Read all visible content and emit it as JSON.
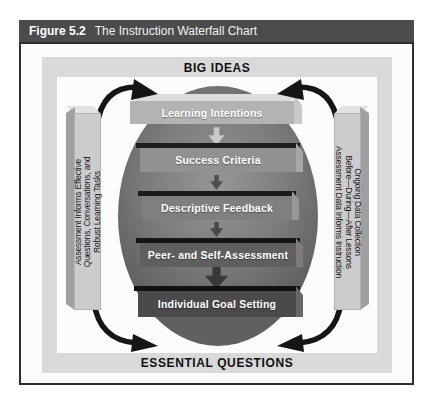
{
  "figure": {
    "label": "Figure 5.2",
    "title": "The Instruction Waterfall Chart"
  },
  "diagram": {
    "top_banner": "BIG IDEAS",
    "bottom_banner": "ESSENTIAL QUESTIONS",
    "left_bar_lines": [
      "Assessment Informs Effective",
      "Questions, Conversations, and",
      "Robust Learning Tasks"
    ],
    "right_bar_lines": [
      "Ongoing Data Collection",
      "Before—During—After Lessons",
      "Assessment Data Informs Instruction"
    ],
    "steps": [
      {
        "label": "Learning Intentions",
        "face": "#b3b3b3",
        "edge": "#dcdcdc",
        "side": "#c9c9c9"
      },
      {
        "label": "Success Criteria",
        "face": "#919191",
        "edge": "#1d1d1d",
        "side": "#a6a6a6"
      },
      {
        "label": "Descriptive Feedback",
        "face": "#7f7f7f",
        "edge": "#1b1b1b",
        "side": "#979797"
      },
      {
        "label": "Peer- and Self-Assessment",
        "face": "#5f5f5f",
        "edge": "#161616",
        "side": "#7d7d7d"
      },
      {
        "label": "Individual Goal Setting",
        "face": "#4a4a4a",
        "edge": "#111111",
        "side": "#676767"
      }
    ],
    "flow_arrow_colors": [
      "#c9c9c9",
      "#4f4f4f",
      "#474747",
      "#383838"
    ],
    "colors": {
      "header_bg": "#4c4c4c",
      "header_text": "#ffffff",
      "frame_border": "#2e2e2e",
      "ring": "#d9d9d9",
      "banner_text": "#111111",
      "ellipse_light": "#969696",
      "ellipse_dark": "#606060",
      "bar_face": "#cccccc",
      "bar_side": "#a0a0a0",
      "bar_top": "#e2e2e2",
      "bar_text": "#1a1a1a",
      "curved_arrow": "#161616",
      "step_text": "#ffffff"
    }
  }
}
